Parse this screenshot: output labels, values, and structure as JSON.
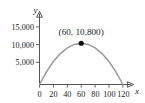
{
  "chart_data": {
    "type": "line",
    "title": "",
    "subtitle": "",
    "xlabel": "x",
    "ylabel": "y",
    "xlim": [
      0,
      128
    ],
    "ylim": [
      0,
      16500
    ],
    "grid": false,
    "legend": null,
    "curve_description": "downward-opening parabola through the origin",
    "x_ticks": [
      0,
      20,
      40,
      60,
      80,
      100,
      120
    ],
    "x_tick_labels": [
      "0",
      "20",
      "40",
      "60",
      "80",
      "100",
      "120"
    ],
    "y_ticks": [
      5000,
      10000,
      15000
    ],
    "y_tick_labels": [
      "5,000",
      "10,000",
      "15,000"
    ],
    "series": [
      {
        "name": "parabola",
        "color": "#9a9a9a",
        "x": [
          0,
          10,
          20,
          30,
          40,
          50,
          60,
          70,
          80,
          90,
          100,
          110,
          120
        ],
        "values": [
          0,
          3300,
          6000,
          8100,
          9600,
          10500,
          10800,
          10500,
          9600,
          8100,
          6000,
          3300,
          0
        ]
      }
    ],
    "annotations": [
      {
        "name": "vertex-label",
        "text": "(60, 10,800)",
        "x": 60,
        "y": 10800,
        "marker": "filled-circle",
        "marker_color": "#111111"
      }
    ],
    "colors": {
      "curve": "#9a9a9a",
      "axis": "#555555",
      "text": "#1a1a1a",
      "marker": "#111111",
      "background": "#ffffff"
    }
  }
}
